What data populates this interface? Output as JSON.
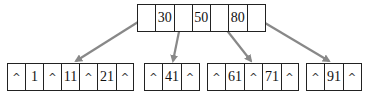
{
  "diagram": {
    "type": "b-tree",
    "root": {
      "cells": [
        "•",
        "30",
        "•",
        "50",
        "•",
        "80",
        "•"
      ]
    },
    "leaves": [
      {
        "cells": [
          "^",
          "1",
          "^",
          "11",
          "^",
          "21",
          "^"
        ]
      },
      {
        "cells": [
          "^",
          "41",
          "^"
        ]
      },
      {
        "cells": [
          "^",
          "61",
          "^",
          "71",
          "^"
        ]
      },
      {
        "cells": [
          "^",
          "91",
          "^"
        ]
      }
    ],
    "pointer_color": "#888888",
    "border_color": "#222222"
  }
}
